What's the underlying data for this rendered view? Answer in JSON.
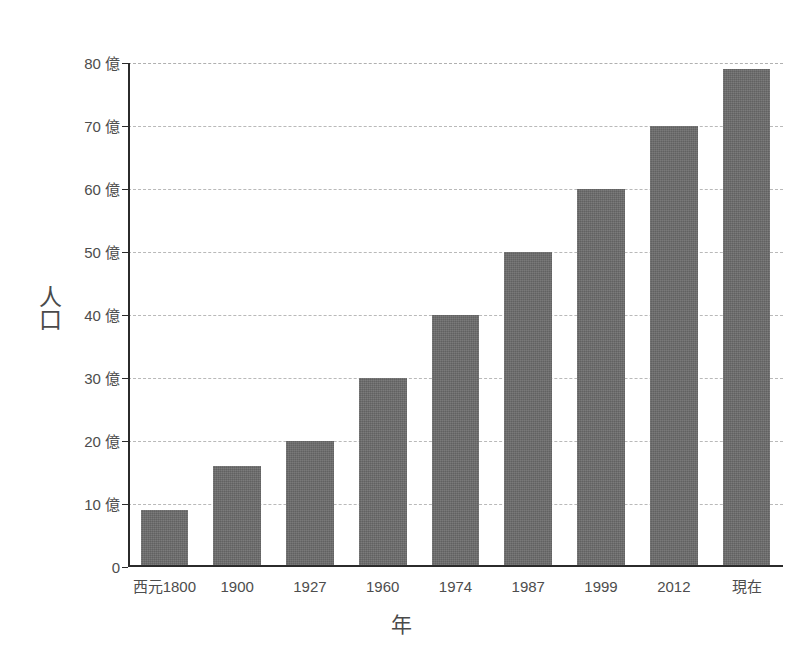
{
  "chart_data": {
    "type": "bar",
    "title": "",
    "subtitle": "",
    "xlabel": "年",
    "ylabel": "人口",
    "categories": [
      "西元1800",
      "1900",
      "1927",
      "1960",
      "1974",
      "1987",
      "1999",
      "2012",
      "現在"
    ],
    "values": [
      9,
      16,
      20,
      30,
      40,
      50,
      60,
      70,
      79
    ],
    "ylim": [
      0,
      80
    ],
    "ytick_values": [
      0,
      10,
      20,
      30,
      40,
      50,
      60,
      70,
      80
    ],
    "ytick_labels": [
      "0",
      "10 億",
      "20 億",
      "30 億",
      "40 億",
      "50 億",
      "60 億",
      "70 億",
      "80 億"
    ],
    "unit_suffix": "億",
    "grid": true,
    "grid_axis": "y",
    "grid_style": "dashed",
    "legend": false,
    "legend_position": "none",
    "series": [
      {
        "name": "人口",
        "values": [
          9,
          16,
          20,
          30,
          40,
          50,
          60,
          70,
          79
        ]
      }
    ],
    "bar_color": "#6b6b6b",
    "axis_color": "#2b2b2b",
    "gridline_color": "#b9b9b9",
    "background_color": "#ffffff",
    "text_color": "#4d4d4d"
  }
}
